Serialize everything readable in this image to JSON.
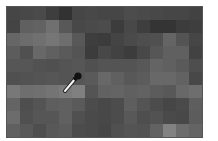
{
  "canvas": {
    "cols": 15,
    "rows": 10,
    "cell_size_px": 13,
    "border_color": "#555555",
    "gray_levels": [
      [
        70,
        72,
        74,
        62,
        50,
        70,
        72,
        70,
        70,
        76,
        74,
        72,
        70,
        70,
        66
      ],
      [
        68,
        96,
        98,
        112,
        88,
        72,
        74,
        76,
        60,
        72,
        62,
        52,
        52,
        60,
        62
      ],
      [
        102,
        108,
        112,
        118,
        110,
        88,
        62,
        60,
        68,
        74,
        78,
        80,
        100,
        84,
        70
      ],
      [
        92,
        80,
        104,
        96,
        90,
        84,
        60,
        72,
        66,
        60,
        72,
        86,
        96,
        96,
        66
      ],
      [
        86,
        86,
        82,
        80,
        84,
        86,
        80,
        84,
        84,
        84,
        88,
        100,
        96,
        90,
        78
      ],
      [
        80,
        82,
        84,
        86,
        84,
        86,
        90,
        104,
        96,
        88,
        92,
        104,
        104,
        98,
        72
      ],
      [
        120,
        110,
        112,
        116,
        122,
        128,
        84,
        98,
        100,
        96,
        98,
        92,
        88,
        104,
        110
      ],
      [
        100,
        78,
        84,
        94,
        96,
        90,
        76,
        72,
        76,
        94,
        84,
        76,
        70,
        74,
        94
      ],
      [
        108,
        80,
        86,
        86,
        96,
        80,
        74,
        72,
        76,
        88,
        78,
        82,
        74,
        72,
        92
      ],
      [
        96,
        88,
        78,
        88,
        92,
        76,
        74,
        70,
        80,
        84,
        82,
        98,
        130,
        108,
        100
      ]
    ]
  },
  "cursor": {
    "icon": "eyedropper-icon",
    "tip_x": 64,
    "tip_y": 91
  }
}
